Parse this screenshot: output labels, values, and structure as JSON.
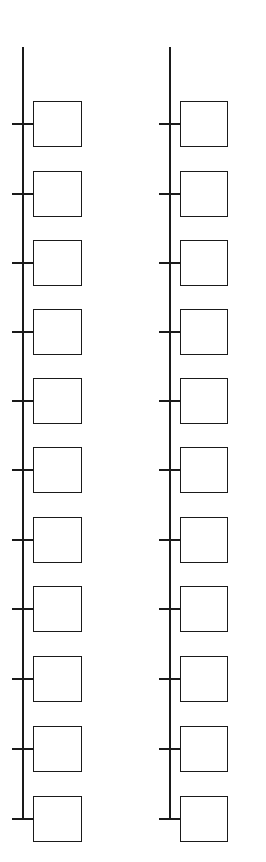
{
  "diagram": {
    "type": "bus-tree",
    "colors": {
      "stroke": "#1a1a1a",
      "background": "#ffffff"
    },
    "columns": [
      {
        "id": "left",
        "spine_x": 22,
        "spine_top": 47,
        "box_left": 33,
        "box_width": 49,
        "tick_left": 12,
        "node_count": 11
      },
      {
        "id": "right",
        "spine_x": 169,
        "spine_top": 47,
        "box_left": 180,
        "box_width": 48,
        "tick_left": 159,
        "node_count": 11
      }
    ],
    "node_tops": [
      101,
      171,
      240,
      309,
      378,
      447,
      517,
      586,
      656,
      726,
      796
    ],
    "box_height": 46,
    "nodes_left": [
      "",
      "",
      "",
      "",
      "",
      "",
      "",
      "",
      "",
      "",
      ""
    ],
    "nodes_right": [
      "",
      "",
      "",
      "",
      "",
      "",
      "",
      "",
      "",
      "",
      ""
    ]
  }
}
